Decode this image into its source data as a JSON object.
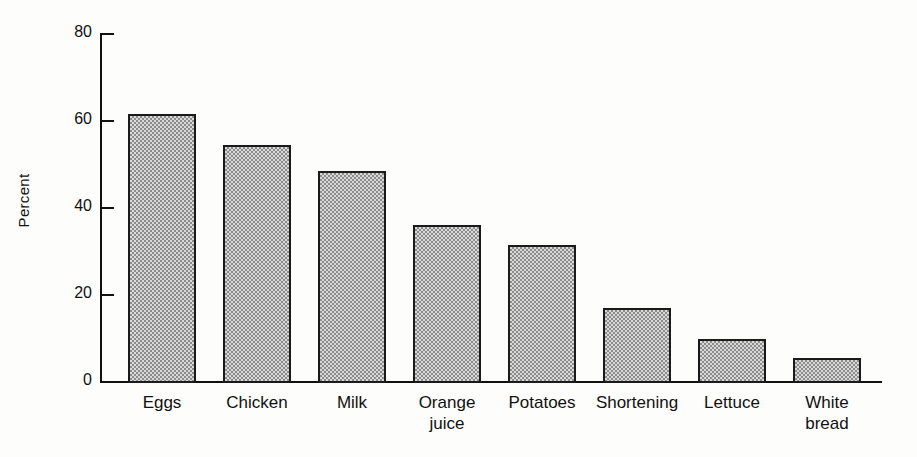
{
  "chart_data": {
    "type": "bar",
    "title": "",
    "subtitle": "",
    "xlabel": "",
    "ylabel": "Percent",
    "ylim": [
      0,
      80
    ],
    "yticks": [
      0,
      20,
      40,
      60,
      80
    ],
    "ytick_labels": [
      "0",
      "20",
      "40",
      "60",
      "80"
    ],
    "grid": false,
    "legend": false,
    "legend_position": "none",
    "categories": [
      "Eggs",
      "Chicken",
      "Milk",
      "Orange juice",
      "Potatoes",
      "Shortening",
      "Lettuce",
      "White bread"
    ],
    "category_labels_multiline": [
      "Eggs",
      "Chicken",
      "Milk",
      "Orange\njuice",
      "Potatoes",
      "Shortening",
      "Lettuce",
      "White\nbread"
    ],
    "values": [
      61.5,
      54.5,
      48.5,
      36.0,
      31.5,
      17.0,
      10.0,
      5.5
    ],
    "bar_fill": "checkerboard-dither-gray",
    "bar_edge_color": "#1a1a1a",
    "background_color": "#fdfdfb",
    "axis_color": "#111111"
  }
}
